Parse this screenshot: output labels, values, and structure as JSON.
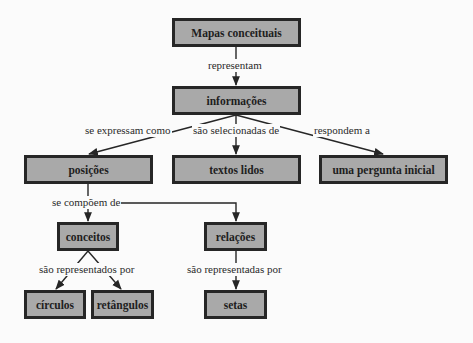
{
  "diagram": {
    "type": "concept-map",
    "colors": {
      "background": "#fbfbfb",
      "node_fill": "#a9a9a9",
      "node_border": "#262626",
      "link": "#262626",
      "text": "#1e1e1e"
    },
    "nodes": {
      "mapas": "Mapas conceituais",
      "informacoes": "informações",
      "posicoes": "posições",
      "textos": "textos lidos",
      "pergunta": "uma pergunta inicial",
      "conceitos": "conceitos",
      "relacoes": "relações",
      "circulos": "círculos",
      "retangulos": "retângulos",
      "setas": "setas"
    },
    "links": {
      "representam": "representam",
      "se_expressam": "se expressam como",
      "selecionadas": "são selecionadas de",
      "respondem": "respondem a",
      "compoem": "se compõem de",
      "representados": "são representados por",
      "representadas": "são representadas por"
    },
    "edges": [
      {
        "from": "Mapas conceituais",
        "to": "informações",
        "label": "representam"
      },
      {
        "from": "informações",
        "to": "posições",
        "label": "se expressam como"
      },
      {
        "from": "informações",
        "to": "textos lidos",
        "label": "são selecionadas de"
      },
      {
        "from": "informações",
        "to": "uma pergunta inicial",
        "label": "respondem a"
      },
      {
        "from": "posições",
        "to": "conceitos",
        "label": "se compõem de"
      },
      {
        "from": "posições",
        "to": "relações",
        "label": "se compõem de"
      },
      {
        "from": "conceitos",
        "to": "círculos",
        "label": "são representados por"
      },
      {
        "from": "conceitos",
        "to": "retângulos",
        "label": "são representados por"
      },
      {
        "from": "relações",
        "to": "setas",
        "label": "são representadas por"
      }
    ]
  }
}
